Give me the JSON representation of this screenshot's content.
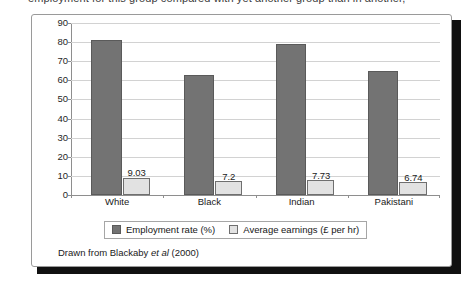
{
  "caption": {
    "text": "employment for this group compared with yet another group than in another,"
  },
  "source_note": {
    "prefix": "Drawn from Blackaby",
    "italic": "et al",
    "suffix": "(2000)"
  },
  "legend": {
    "items": [
      {
        "label": "Employment rate (%)",
        "color": "#737373",
        "swatch": "rate"
      },
      {
        "label": "Average earnings (£ per hr)",
        "color": "#e2e2e2",
        "swatch": "earn"
      }
    ]
  },
  "colors": {
    "rate_bar": "#737373",
    "rate_bar_border": "#5a5a5a",
    "earn_bar": "#e2e2e2",
    "earn_bar_border": "#6f6f6f",
    "gridline": "#d2d2d2",
    "axis": "#8e8e8e",
    "frame_border": "#9a9a9a",
    "shadow": "#111111"
  },
  "chart_data": {
    "type": "bar",
    "title": "",
    "xlabel": "",
    "ylabel": "",
    "categories": [
      "White",
      "Black",
      "Indian",
      "Pakistani"
    ],
    "ylim": [
      0,
      90
    ],
    "yticks": [
      0,
      10,
      20,
      30,
      40,
      50,
      60,
      70,
      80,
      90
    ],
    "ytick_labels": [
      "0",
      "10",
      "20",
      "30",
      "40",
      "50",
      "60",
      "70",
      "80",
      "90"
    ],
    "grid": true,
    "legend_position": "bottom",
    "series": [
      {
        "name": "Employment rate (%)",
        "color": "#737373",
        "values": [
          81,
          63,
          79,
          65
        ],
        "labels": [
          "",
          "",
          "",
          ""
        ]
      },
      {
        "name": "Average earnings (£ per hr)",
        "color": "#e2e2e2",
        "values": [
          9.03,
          7.2,
          7.73,
          6.74
        ],
        "labels": [
          "9.03",
          "7.2",
          "7.73",
          "6.74"
        ]
      }
    ]
  }
}
